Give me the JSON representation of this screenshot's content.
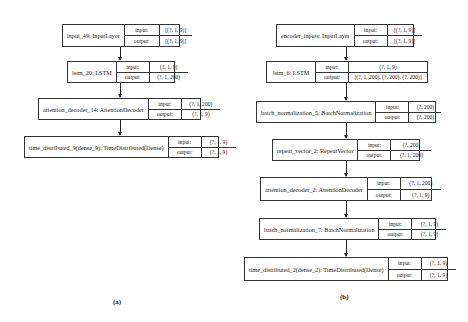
{
  "io_labels": {
    "input": "input:",
    "output": "output:"
  },
  "diagram_a": {
    "caption": "(a)",
    "nodes": [
      {
        "name": "input_49: InputLayer",
        "input": "[(?, 1, 9)]",
        "output": "[(?, 1, 9)]"
      },
      {
        "name": "lstm_20: LSTM",
        "input": "(?, 1, 9)",
        "output": "(?, 1, 200)"
      },
      {
        "name": "attention_decoder_14: AttentionDecoder",
        "input": "(?, 1, 200)",
        "output": "(?, 1, 9)"
      },
      {
        "name": "time_distributed_9(dense_9): TimeDistributed(Dense)",
        "input": "(?, 1, 9)",
        "output": "(?, 1, 9)"
      }
    ]
  },
  "diagram_b": {
    "caption": "(b)",
    "nodes": [
      {
        "name": "encoder_inputs: InputLayer",
        "input": "[(?, 1, 9)]",
        "output": "[(?, 1, 9)]"
      },
      {
        "name": "lstm_6: LSTM",
        "input": "(?, 1, 9)",
        "output": "[(?, 1, 200), (?, 200), (?, 200)]"
      },
      {
        "name": "batch_normalization_5: BatchNormalization",
        "input": "(?, 200)",
        "output": "(?, 200)"
      },
      {
        "name": "repeat_vector_2: RepeatVector",
        "input": "(?, 200)",
        "output": "(?, 1, 200)"
      },
      {
        "name": "attention_decoder_2: AttentionDecoder",
        "input": "(?, 1, 200)",
        "output": "(?, 1, 9)"
      },
      {
        "name": "batch_normalization_7: BatchNormalization",
        "input": "(?, 1, 9)",
        "output": "(?, 1, 9)"
      },
      {
        "name": "time_distributed_2(dense_2): TimeDistributed(Dense)",
        "input": "(?, 1, 9)",
        "output": "(?, 1, 9)"
      }
    ]
  }
}
